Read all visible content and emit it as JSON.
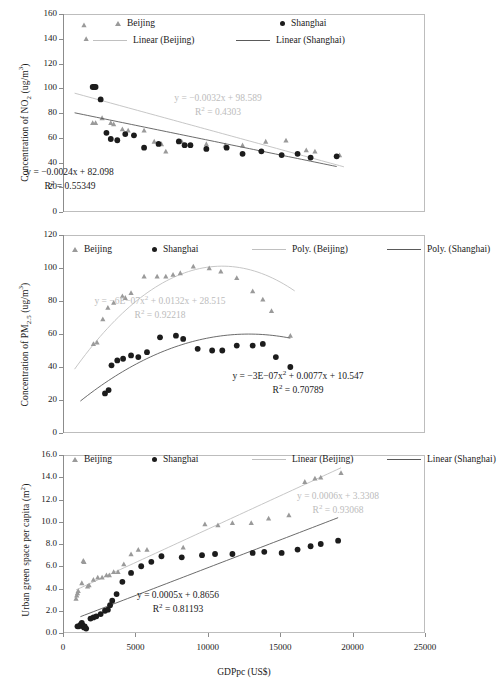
{
  "figure": {
    "xlabel": "GDPpc (US$)",
    "xticks": [
      "0",
      "5000",
      "10000",
      "15000",
      "20000",
      "25000"
    ],
    "xlim": [
      0,
      25000
    ],
    "colors": {
      "beijing_marker": "#9a9a9a",
      "shanghai_marker": "#1c1c1c",
      "beijing_line": "#c0c0c0",
      "shanghai_line": "#5a5a5a",
      "frame": "#bdbdbd"
    }
  },
  "chart_data": [
    {
      "type": "scatter",
      "title": "",
      "xlabel": "",
      "ylabel": "Concentration of NO2 (ug/m3)",
      "ylabel_parts": {
        "pre": "Concentration of NO",
        "sub": "2",
        "post": " (ug/m",
        "sup": "3",
        "tail": ")"
      },
      "xlim": [
        0,
        25000
      ],
      "ylim": [
        0,
        160
      ],
      "yticks": [
        "0",
        "20",
        "40",
        "60",
        "80",
        "100",
        "120",
        "140",
        "160"
      ],
      "xticks": [
        "0",
        "5000",
        "10000",
        "15000",
        "20000",
        "25000"
      ],
      "grid": false,
      "legend": {
        "position": "top",
        "entries": [
          "Beijing",
          "Shanghai",
          "Linear (Beijing)",
          "Linear (Shanghai)"
        ]
      },
      "annotations": [
        {
          "text": "y = -0.0032x + 98.589",
          "text2": "R2 = 0.4303",
          "series": "Beijing",
          "color": "#bcbcbc"
        },
        {
          "text": "y = -0.0024x + 82.098",
          "text2": "R2 = 0.55349",
          "series": "Shanghai",
          "color": "#1a1a1a"
        }
      ],
      "series": [
        {
          "name": "Beijing",
          "marker": "triangle",
          "points": [
            [
              1450,
              151
            ],
            [
              1600,
              140
            ],
            [
              2050,
              72
            ],
            [
              2250,
              72
            ],
            [
              2700,
              76
            ],
            [
              3300,
              72
            ],
            [
              3500,
              71
            ],
            [
              4100,
              67
            ],
            [
              4500,
              66
            ],
            [
              5600,
              66
            ],
            [
              6300,
              57
            ],
            [
              6800,
              55
            ],
            [
              7100,
              49
            ],
            [
              8200,
              57
            ],
            [
              9900,
              55
            ],
            [
              11200,
              54
            ],
            [
              12400,
              54
            ],
            [
              14000,
              57
            ],
            [
              15400,
              58
            ],
            [
              16800,
              50
            ],
            [
              17400,
              49
            ],
            [
              19100,
              46
            ]
          ],
          "trend": {
            "type": "linear",
            "slope": -0.0032,
            "intercept": 98.589,
            "r2": 0.4303,
            "x_start": 800,
            "x_end": 19400
          }
        },
        {
          "name": "Shanghai",
          "marker": "circle",
          "points": [
            [
              2050,
              101
            ],
            [
              2150,
              101
            ],
            [
              2250,
              101
            ],
            [
              2600,
              91
            ],
            [
              3000,
              64
            ],
            [
              3300,
              59
            ],
            [
              3750,
              58
            ],
            [
              4300,
              63
            ],
            [
              4900,
              62
            ],
            [
              5600,
              52
            ],
            [
              6600,
              55
            ],
            [
              8000,
              57
            ],
            [
              8400,
              54
            ],
            [
              8800,
              54
            ],
            [
              9900,
              51
            ],
            [
              11300,
              52
            ],
            [
              12400,
              47
            ],
            [
              13700,
              49
            ],
            [
              15100,
              46
            ],
            [
              16200,
              47
            ],
            [
              17100,
              44
            ],
            [
              18900,
              45
            ]
          ],
          "trend": {
            "type": "linear",
            "slope": -0.0024,
            "intercept": 82.098,
            "r2": 0.55349,
            "x_start": 800,
            "x_end": 18900
          }
        }
      ]
    },
    {
      "type": "scatter",
      "title": "",
      "xlabel": "",
      "ylabel": "Concentration of PM2.5 (ug/m3)",
      "ylabel_parts": {
        "pre": "Concentration of  PM",
        "sub": "2.5",
        "post": " (ug/m",
        "sup": "3",
        "tail": ")"
      },
      "xlim": [
        0,
        25000
      ],
      "ylim": [
        0,
        120
      ],
      "yticks": [
        "0",
        "20",
        "40",
        "60",
        "80",
        "100",
        "120"
      ],
      "xticks": [
        "0",
        "5000",
        "10000",
        "15000",
        "20000",
        "25000"
      ],
      "grid": false,
      "legend": {
        "position": "top",
        "entries": [
          "Beijing",
          "Shanghai",
          "Poly. (Beijing)",
          "Poly. (Shanghai)"
        ]
      },
      "annotations": [
        {
          "text": "y = -6E-07x2 + 0.0132x + 28.515",
          "text2": "R2 = 0.92218",
          "series": "Beijing",
          "color": "#bcbcbc"
        },
        {
          "text": "y = -3E-07x2 + 0.0077x + 10.547",
          "text2": "R2 = 0.70789",
          "series": "Shanghai",
          "color": "#1a1a1a"
        }
      ],
      "series": [
        {
          "name": "Beijing",
          "marker": "triangle",
          "points": [
            [
              2100,
              54
            ],
            [
              2350,
              55
            ],
            [
              2750,
              69
            ],
            [
              3100,
              76
            ],
            [
              3500,
              79
            ],
            [
              4100,
              83
            ],
            [
              4300,
              82
            ],
            [
              4700,
              85
            ],
            [
              5600,
              95
            ],
            [
              6500,
              95
            ],
            [
              7100,
              95
            ],
            [
              7600,
              96
            ],
            [
              8100,
              97
            ],
            [
              9000,
              101
            ],
            [
              10100,
              100
            ],
            [
              10900,
              98
            ],
            [
              12000,
              94
            ],
            [
              13100,
              86
            ],
            [
              13800,
              81
            ],
            [
              14400,
              74
            ],
            [
              15700,
              59
            ]
          ],
          "trend": {
            "type": "poly2",
            "a": -6e-07,
            "b": 0.0132,
            "c": 28.515,
            "r2": 0.92218,
            "x_start": 800,
            "x_end": 16000
          }
        },
        {
          "name": "Shanghai",
          "marker": "circle",
          "points": [
            [
              2900,
              24
            ],
            [
              3150,
              26
            ],
            [
              3350,
              41
            ],
            [
              3750,
              44
            ],
            [
              4150,
              45
            ],
            [
              4700,
              47
            ],
            [
              5200,
              46
            ],
            [
              5800,
              49
            ],
            [
              6700,
              58
            ],
            [
              7800,
              59
            ],
            [
              8300,
              57
            ],
            [
              9300,
              51
            ],
            [
              10300,
              50
            ],
            [
              11000,
              50
            ],
            [
              12000,
              53
            ],
            [
              13100,
              53
            ],
            [
              13800,
              54
            ],
            [
              14700,
              46
            ],
            [
              15700,
              40
            ]
          ],
          "trend": {
            "type": "poly2",
            "a": -3e-07,
            "b": 0.0077,
            "c": 10.547,
            "r2": 0.70789,
            "x_start": 1200,
            "x_end": 15700
          }
        }
      ]
    },
    {
      "type": "scatter",
      "title": "",
      "xlabel": "GDPpc (US$)",
      "ylabel": "Urban green space per capita (m2)",
      "ylabel_parts": {
        "pre": "Urban green space per capita (m",
        "sub": "",
        "post": "",
        "sup": "2",
        "tail": ")"
      },
      "xlim": [
        0,
        25000
      ],
      "ylim": [
        0.0,
        16.0
      ],
      "yticks": [
        "0.0",
        "2.0",
        "4.0",
        "6.0",
        "8.0",
        "10.0",
        "12.0",
        "14.0",
        "16.0"
      ],
      "xticks": [
        "0",
        "5000",
        "10000",
        "15000",
        "20000",
        "25000"
      ],
      "grid": false,
      "legend": {
        "position": "top",
        "entries": [
          "Beijing",
          "Shanghai",
          "Linear (Beijing)",
          "Linear (Shanghai)"
        ]
      },
      "annotations": [
        {
          "text": "y = 0.0006x + 3.3308",
          "text2": "R2 = 0.93068",
          "series": "Beijing",
          "color": "#bcbcbc"
        },
        {
          "text": "y = 0.0005x + 0.8656",
          "text2": "R2 = 0.81193",
          "series": "Shanghai",
          "color": "#1a1a1a"
        }
      ],
      "series": [
        {
          "name": "Beijing",
          "marker": "triangle",
          "points": [
            [
              900,
              3.1
            ],
            [
              950,
              3.4
            ],
            [
              1000,
              3.6
            ],
            [
              1050,
              3.8
            ],
            [
              1300,
              4.5
            ],
            [
              1400,
              6.5
            ],
            [
              1450,
              6.4
            ],
            [
              1700,
              4.2
            ],
            [
              1800,
              4.3
            ],
            [
              2100,
              4.8
            ],
            [
              2400,
              5.0
            ],
            [
              2700,
              5.0
            ],
            [
              3000,
              5.2
            ],
            [
              3200,
              5.2
            ],
            [
              3500,
              5.5
            ],
            [
              3800,
              5.5
            ],
            [
              4200,
              6.2
            ],
            [
              4700,
              7.1
            ],
            [
              5200,
              7.5
            ],
            [
              5800,
              7.5
            ],
            [
              8300,
              7.7
            ],
            [
              9800,
              9.8
            ],
            [
              10700,
              9.7
            ],
            [
              11700,
              9.9
            ],
            [
              13000,
              9.9
            ],
            [
              14200,
              10.3
            ],
            [
              15600,
              10.6
            ],
            [
              16700,
              13.6
            ],
            [
              17400,
              13.9
            ],
            [
              17800,
              14.0
            ],
            [
              19200,
              14.4
            ]
          ],
          "trend": {
            "type": "linear",
            "slope": 0.0006,
            "intercept": 3.3308,
            "r2": 0.93068,
            "x_start": 900,
            "x_end": 19200
          }
        },
        {
          "name": "Shanghai",
          "marker": "circle",
          "points": [
            [
              1000,
              0.6
            ],
            [
              1100,
              0.6
            ],
            [
              1200,
              0.7
            ],
            [
              1250,
              0.8
            ],
            [
              1300,
              0.9
            ],
            [
              1350,
              0.7
            ],
            [
              1400,
              0.6
            ],
            [
              1450,
              0.5
            ],
            [
              1500,
              0.6
            ],
            [
              1600,
              0.4
            ],
            [
              1900,
              1.3
            ],
            [
              2100,
              1.4
            ],
            [
              2300,
              1.5
            ],
            [
              2600,
              1.7
            ],
            [
              2900,
              2.0
            ],
            [
              3100,
              2.1
            ],
            [
              3250,
              2.5
            ],
            [
              3400,
              2.9
            ],
            [
              3700,
              3.5
            ],
            [
              4100,
              4.6
            ],
            [
              4700,
              5.4
            ],
            [
              5400,
              6.0
            ],
            [
              6100,
              6.4
            ],
            [
              6800,
              6.9
            ],
            [
              8200,
              6.8
            ],
            [
              9600,
              7.0
            ],
            [
              10500,
              7.1
            ],
            [
              11700,
              7.1
            ],
            [
              13100,
              7.2
            ],
            [
              13900,
              7.3
            ],
            [
              15100,
              7.2
            ],
            [
              16200,
              7.5
            ],
            [
              17100,
              7.8
            ],
            [
              17800,
              8.0
            ],
            [
              19000,
              8.3
            ]
          ],
          "trend": {
            "type": "linear",
            "slope": 0.0005,
            "intercept": 0.8656,
            "r2": 0.81193,
            "x_start": 1200,
            "x_end": 19000
          }
        }
      ]
    }
  ]
}
